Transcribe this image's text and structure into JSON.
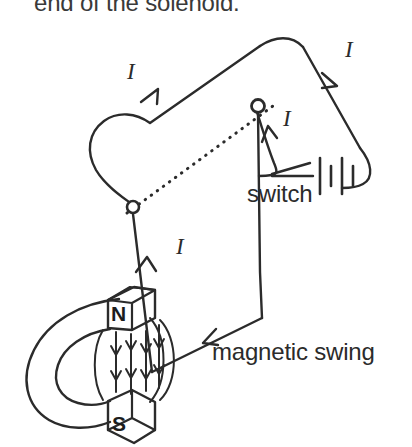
{
  "figure": {
    "background_color": "#ffffff",
    "ink_color": "#2b2b2b"
  },
  "captions": {
    "top_fragment": "end of the solenoid.",
    "switch": "switch",
    "magnetic_swing": "magnetic swing"
  },
  "magnet": {
    "north_label": "N",
    "south_label": "S",
    "field_direction": "downward",
    "field_line_count": 4
  },
  "current_labels": [
    {
      "id": "current-left-rail",
      "text": "I",
      "x": 127,
      "y": 60
    },
    {
      "id": "current-right-rail",
      "text": "I",
      "x": 345,
      "y": 38
    },
    {
      "id": "current-switch-lead",
      "text": "I",
      "x": 283,
      "y": 107
    },
    {
      "id": "current-swing-riser",
      "text": "I",
      "x": 176,
      "y": 235
    }
  ],
  "components": {
    "battery": "two-cell battery",
    "pivot_left": "pivot ring left",
    "pivot_right": "pivot ring right",
    "axis": "dotted rotation axis"
  }
}
